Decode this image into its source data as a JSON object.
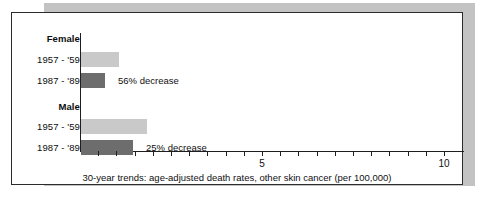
{
  "chart_data": {
    "type": "bar",
    "orientation": "horizontal",
    "title": "",
    "caption": "30-year trends: age-adjusted death rates, other skin cancer (per 100,000)",
    "xlabel": "",
    "ylabel": "",
    "xlim": [
      0,
      10.55
    ],
    "grid": false,
    "legend": "none",
    "units": "per 100,000",
    "tick_values": [
      0,
      0.5,
      1,
      1.5,
      2,
      2.5,
      3,
      3.5,
      4,
      4.5,
      5,
      5.5,
      6,
      6.5,
      7,
      7.5,
      8,
      8.5,
      9,
      9.5,
      10
    ],
    "tick_labels": [
      {
        "value": 5,
        "label": "5"
      },
      {
        "value": 10,
        "label": "10"
      }
    ],
    "groups": [
      {
        "name": "Female",
        "annotation": "56% decrease",
        "bars": [
          {
            "category": "1957 - '59",
            "value": 1.05,
            "series": "early"
          },
          {
            "category": "1987 - '89",
            "value": 0.66,
            "series": "late"
          }
        ]
      },
      {
        "name": "Male",
        "annotation": "25% decrease",
        "bars": [
          {
            "category": "1957 - '59",
            "value": 1.82,
            "series": "early"
          },
          {
            "category": "1987 - '89",
            "value": 1.43,
            "series": "late"
          }
        ]
      }
    ],
    "colors": {
      "early_bar": "#c9c9c9",
      "late_bar": "#6d6d6d",
      "axis": "#1e1e1e",
      "text": "#101010",
      "frame_border": "#2b2b2b",
      "shadow": "#c3c3c3",
      "background": "#ffffff"
    }
  },
  "labels": {
    "female_group": "Female",
    "female_early": "1957 - '59",
    "female_late": "1987 - '89",
    "male_group": "Male",
    "male_early": "1957 - '59",
    "male_late": "1987 - '89",
    "female_annotation": "56% decrease",
    "male_annotation": "25% decrease",
    "tick_5": "5",
    "tick_10": "10",
    "caption": "30-year trends: age-adjusted death rates, other skin cancer (per 100,000)"
  }
}
